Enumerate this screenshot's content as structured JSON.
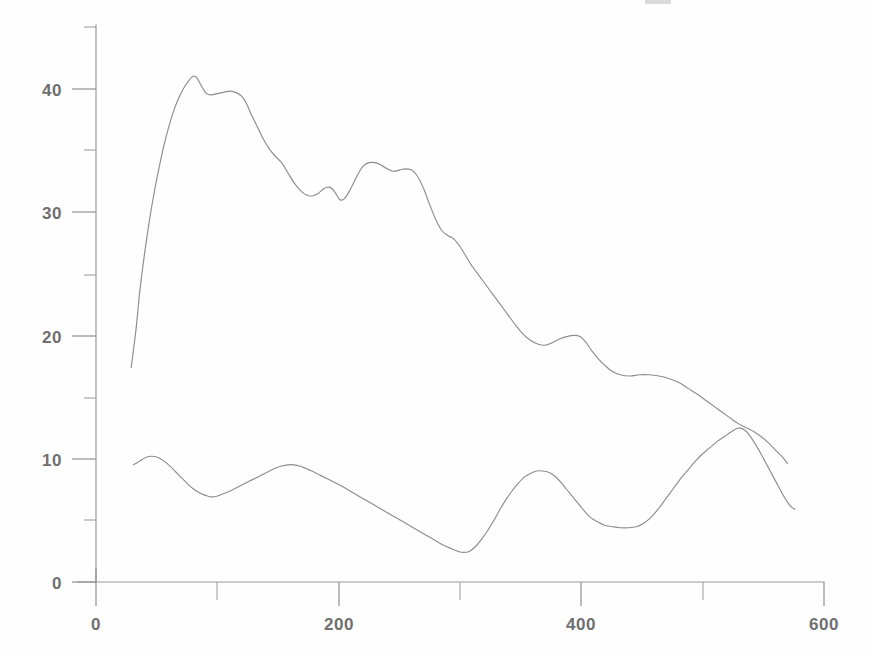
{
  "chart_data": {
    "type": "line",
    "title": "",
    "subtitle": "",
    "xlabel": "",
    "ylabel": "",
    "xlim": [
      0,
      600
    ],
    "ylim": [
      0,
      45
    ],
    "grid": false,
    "legend": "none",
    "x_ticks_major": [
      0,
      200,
      400,
      600
    ],
    "x_ticks_minor": [
      100,
      300,
      500
    ],
    "y_ticks_major": [
      0,
      10,
      20,
      30,
      40
    ],
    "y_ticks_minor": [
      5,
      15,
      25,
      35,
      45
    ],
    "x_tick_labels": [
      "0",
      "200",
      "400",
      "600"
    ],
    "y_tick_labels": [
      "0",
      "10",
      "20",
      "30",
      "40"
    ],
    "line_color": "#8d8d8d",
    "axis_color": "#9a9a9a",
    "background_color": "#fefefe",
    "series": [
      {
        "name": "upper-curve",
        "points": [
          [
            29,
            17.4
          ],
          [
            33,
            20.5
          ],
          [
            36,
            23.5
          ],
          [
            40,
            26.6
          ],
          [
            44,
            29.3
          ],
          [
            48,
            31.6
          ],
          [
            52,
            33.6
          ],
          [
            56,
            35.4
          ],
          [
            60,
            36.9
          ],
          [
            64,
            38.2
          ],
          [
            68,
            39.2
          ],
          [
            72,
            40.0
          ],
          [
            76,
            40.6
          ],
          [
            80,
            41.0
          ],
          [
            83,
            40.9
          ],
          [
            87,
            40.2
          ],
          [
            91,
            39.6
          ],
          [
            95,
            39.5
          ],
          [
            100,
            39.6
          ],
          [
            105,
            39.7
          ],
          [
            110,
            39.8
          ],
          [
            115,
            39.7
          ],
          [
            120,
            39.4
          ],
          [
            124,
            38.8
          ],
          [
            128,
            37.9
          ],
          [
            133,
            36.9
          ],
          [
            138,
            35.9
          ],
          [
            143,
            35.1
          ],
          [
            148,
            34.5
          ],
          [
            153,
            34.0
          ],
          [
            158,
            33.2
          ],
          [
            163,
            32.4
          ],
          [
            168,
            31.8
          ],
          [
            173,
            31.4
          ],
          [
            178,
            31.3
          ],
          [
            183,
            31.5
          ],
          [
            188,
            31.9
          ],
          [
            193,
            32.0
          ],
          [
            197,
            31.6
          ],
          [
            201,
            31.0
          ],
          [
            205,
            31.1
          ],
          [
            210,
            31.9
          ],
          [
            215,
            32.9
          ],
          [
            220,
            33.7
          ],
          [
            225,
            34.0
          ],
          [
            230,
            34.0
          ],
          [
            235,
            33.8
          ],
          [
            240,
            33.5
          ],
          [
            245,
            33.3
          ],
          [
            250,
            33.4
          ],
          [
            255,
            33.5
          ],
          [
            260,
            33.4
          ],
          [
            265,
            32.9
          ],
          [
            270,
            31.9
          ],
          [
            275,
            30.6
          ],
          [
            280,
            29.4
          ],
          [
            285,
            28.5
          ],
          [
            290,
            28.1
          ],
          [
            295,
            27.8
          ],
          [
            300,
            27.2
          ],
          [
            305,
            26.4
          ],
          [
            310,
            25.6
          ],
          [
            316,
            24.8
          ],
          [
            322,
            24.0
          ],
          [
            328,
            23.2
          ],
          [
            334,
            22.4
          ],
          [
            340,
            21.6
          ],
          [
            346,
            20.8
          ],
          [
            352,
            20.1
          ],
          [
            358,
            19.6
          ],
          [
            364,
            19.3
          ],
          [
            370,
            19.2
          ],
          [
            376,
            19.4
          ],
          [
            382,
            19.7
          ],
          [
            388,
            19.9
          ],
          [
            394,
            20.0
          ],
          [
            399,
            19.9
          ],
          [
            404,
            19.4
          ],
          [
            409,
            18.7
          ],
          [
            414,
            18.1
          ],
          [
            419,
            17.6
          ],
          [
            425,
            17.1
          ],
          [
            432,
            16.8
          ],
          [
            440,
            16.7
          ],
          [
            448,
            16.8
          ],
          [
            456,
            16.8
          ],
          [
            464,
            16.7
          ],
          [
            472,
            16.5
          ],
          [
            480,
            16.2
          ],
          [
            488,
            15.7
          ],
          [
            496,
            15.2
          ],
          [
            503,
            14.7
          ],
          [
            510,
            14.2
          ],
          [
            517,
            13.7
          ],
          [
            524,
            13.2
          ],
          [
            530,
            12.8
          ],
          [
            536,
            12.5
          ],
          [
            542,
            12.2
          ],
          [
            548,
            11.8
          ],
          [
            554,
            11.3
          ],
          [
            560,
            10.7
          ],
          [
            566,
            10.1
          ],
          [
            570,
            9.6
          ]
        ]
      },
      {
        "name": "lower-curve",
        "points": [
          [
            31,
            9.5
          ],
          [
            36,
            9.8
          ],
          [
            41,
            10.1
          ],
          [
            46,
            10.2
          ],
          [
            51,
            10.1
          ],
          [
            56,
            9.8
          ],
          [
            61,
            9.4
          ],
          [
            66,
            8.9
          ],
          [
            71,
            8.4
          ],
          [
            76,
            7.9
          ],
          [
            81,
            7.5
          ],
          [
            86,
            7.2
          ],
          [
            91,
            7.0
          ],
          [
            96,
            6.9
          ],
          [
            101,
            7.0
          ],
          [
            106,
            7.2
          ],
          [
            111,
            7.4
          ],
          [
            117,
            7.7
          ],
          [
            123,
            8.0
          ],
          [
            129,
            8.3
          ],
          [
            135,
            8.6
          ],
          [
            141,
            8.9
          ],
          [
            147,
            9.2
          ],
          [
            153,
            9.4
          ],
          [
            158,
            9.5
          ],
          [
            163,
            9.5
          ],
          [
            168,
            9.4
          ],
          [
            173,
            9.2
          ],
          [
            178,
            9.0
          ],
          [
            184,
            8.7
          ],
          [
            190,
            8.4
          ],
          [
            196,
            8.1
          ],
          [
            202,
            7.8
          ],
          [
            209,
            7.4
          ],
          [
            216,
            7.0
          ],
          [
            223,
            6.6
          ],
          [
            230,
            6.2
          ],
          [
            237,
            5.8
          ],
          [
            244,
            5.4
          ],
          [
            251,
            5.0
          ],
          [
            258,
            4.6
          ],
          [
            265,
            4.2
          ],
          [
            272,
            3.8
          ],
          [
            279,
            3.4
          ],
          [
            286,
            3.0
          ],
          [
            293,
            2.7
          ],
          [
            298,
            2.5
          ],
          [
            303,
            2.4
          ],
          [
            308,
            2.5
          ],
          [
            313,
            2.9
          ],
          [
            318,
            3.5
          ],
          [
            323,
            4.2
          ],
          [
            328,
            5.0
          ],
          [
            333,
            5.9
          ],
          [
            338,
            6.7
          ],
          [
            343,
            7.4
          ],
          [
            348,
            8.0
          ],
          [
            353,
            8.5
          ],
          [
            358,
            8.8
          ],
          [
            363,
            9.0
          ],
          [
            368,
            9.0
          ],
          [
            373,
            8.9
          ],
          [
            378,
            8.6
          ],
          [
            383,
            8.1
          ],
          [
            388,
            7.5
          ],
          [
            393,
            6.9
          ],
          [
            398,
            6.3
          ],
          [
            403,
            5.7
          ],
          [
            408,
            5.2
          ],
          [
            413,
            4.9
          ],
          [
            419,
            4.6
          ],
          [
            425,
            4.5
          ],
          [
            432,
            4.4
          ],
          [
            439,
            4.4
          ],
          [
            446,
            4.5
          ],
          [
            452,
            4.8
          ],
          [
            458,
            5.3
          ],
          [
            464,
            6.0
          ],
          [
            470,
            6.8
          ],
          [
            476,
            7.6
          ],
          [
            482,
            8.4
          ],
          [
            488,
            9.1
          ],
          [
            494,
            9.8
          ],
          [
            500,
            10.4
          ],
          [
            506,
            10.9
          ],
          [
            512,
            11.4
          ],
          [
            518,
            11.8
          ],
          [
            524,
            12.2
          ],
          [
            530,
            12.5
          ],
          [
            536,
            12.2
          ],
          [
            542,
            11.4
          ],
          [
            548,
            10.4
          ],
          [
            554,
            9.3
          ],
          [
            560,
            8.2
          ],
          [
            566,
            7.1
          ],
          [
            572,
            6.2
          ],
          [
            576,
            5.9
          ]
        ]
      }
    ]
  },
  "axes": {
    "y_axis_top_label": "",
    "x_axis_right_label": ""
  },
  "artifacts": {
    "top_smudge": ""
  }
}
